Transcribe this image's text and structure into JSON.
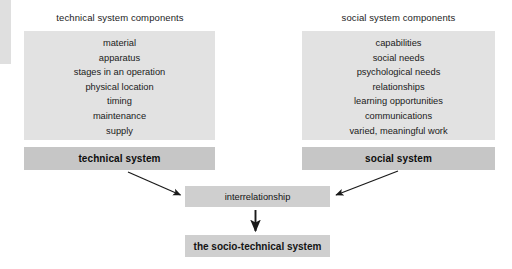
{
  "diagram": {
    "title": "the socio-technical system",
    "columns": [
      {
        "heading": "technical system components",
        "items": [
          "material",
          "apparatus",
          "stages in an operation",
          "physical location",
          "timing",
          "maintenance",
          "supply"
        ],
        "system_label": "technical system"
      },
      {
        "heading": "social system components",
        "items": [
          "capabilities",
          "social needs",
          "psychological needs",
          "relationships",
          "learning opportunities",
          "communications",
          "varied, meaningful work"
        ],
        "system_label": "social system"
      }
    ],
    "interrelationship_label": "interrelationship",
    "result_label": "the socio-technical system",
    "colors": {
      "component_box": "#e2e2e2",
      "system_bar": "#c6c6c6",
      "node_box": "#cfcfcf",
      "arrow": "#1a1a1a",
      "text": "#1a1a1a",
      "background": "#ffffff"
    },
    "arrows": [
      {
        "name": "technical-to-interrelationship",
        "from": "technical system",
        "to": "interrelationship"
      },
      {
        "name": "social-to-interrelationship",
        "from": "social system",
        "to": "interrelationship"
      },
      {
        "name": "interrelationship-to-result",
        "from": "interrelationship",
        "to": "the socio-technical system"
      }
    ]
  }
}
